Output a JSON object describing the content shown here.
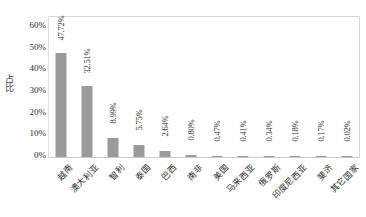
{
  "chart_data": {
    "type": "bar",
    "title": "",
    "subtitle": "",
    "xlabel": "",
    "ylabel": "占比",
    "ylim": [
      0,
      65
    ],
    "grid": false,
    "legend": null,
    "orientation": "vertical",
    "bar_color": "#9a9a9a",
    "categories": [
      "越南",
      "澳大利亚",
      "智利",
      "泰国",
      "巴西",
      "南非",
      "美国",
      "马来西亚",
      "俄罗斯",
      "印度尼西亚",
      "斐济",
      "其它国家"
    ],
    "values": [
      47.72,
      32.51,
      8.99,
      5.75,
      2.64,
      0.8,
      0.47,
      0.41,
      0.34,
      0.18,
      0.17,
      0.02
    ],
    "value_labels": [
      "47.72%",
      "32.51%",
      "8.99%",
      "5.75%",
      "2.64%",
      "0.80%",
      "0.47%",
      "0.41%",
      "0.34%",
      "0.18%",
      "0.17%",
      "0.02%"
    ],
    "yticks": [
      0,
      10,
      20,
      30,
      40,
      50,
      60
    ],
    "ytick_labels": [
      "0%",
      "10%",
      "20%",
      "30%",
      "40%",
      "50%",
      "60%"
    ]
  }
}
